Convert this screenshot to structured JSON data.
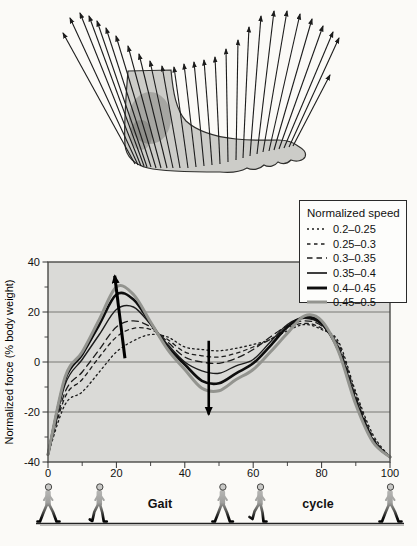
{
  "figure": {
    "background": "#fbfaf7"
  },
  "foot_diagram": {
    "description": "ground reaction force vectors over foot silhouette during stance",
    "foot_fill": "#ccccc8",
    "vector_color": "#1c1c1c",
    "vectors": [
      [
        135,
        164,
        63,
        33
      ],
      [
        138,
        165,
        70,
        18
      ],
      [
        141,
        166,
        80,
        13
      ],
      [
        144,
        166,
        89,
        16
      ],
      [
        147,
        167,
        97,
        21
      ],
      [
        151,
        167,
        106,
        28
      ],
      [
        156,
        168,
        116,
        36
      ],
      [
        161,
        168,
        128,
        46
      ],
      [
        167,
        168,
        139,
        54
      ],
      [
        173,
        168,
        150,
        61
      ],
      [
        180,
        168,
        162,
        66
      ],
      [
        188,
        168,
        174,
        67
      ],
      [
        196,
        167,
        184,
        64
      ],
      [
        204,
        166,
        194,
        62
      ],
      [
        212,
        165,
        204,
        60
      ],
      [
        220,
        164,
        215,
        57
      ],
      [
        228,
        162,
        226,
        49
      ],
      [
        236,
        160,
        238,
        40
      ],
      [
        243,
        158,
        249,
        27
      ],
      [
        250,
        156,
        261,
        16
      ],
      [
        257,
        154,
        274,
        11
      ],
      [
        263,
        152,
        287,
        11
      ],
      [
        269,
        151,
        300,
        14
      ],
      [
        274,
        150,
        312,
        19
      ],
      [
        279,
        149,
        323,
        26
      ],
      [
        284,
        148,
        333,
        32
      ],
      [
        289,
        147,
        339,
        38
      ],
      [
        293,
        146,
        330,
        75
      ]
    ]
  },
  "chart_data": {
    "type": "line",
    "title": "",
    "ylabel": "Normalized force (% body weight)",
    "xlabel": "Gait cycle",
    "xlim": [
      0,
      100
    ],
    "ylim": [
      -40,
      40
    ],
    "plot_bg": "#dadad7",
    "grid_y": [
      20,
      0,
      -20
    ],
    "xticks": [
      0,
      20,
      40,
      60,
      80,
      100
    ],
    "xticks_minor": [
      10,
      30,
      50,
      70,
      90
    ],
    "yticks": [
      40,
      20,
      0,
      -20,
      -40
    ],
    "yticks_minor": [
      30,
      10,
      -10,
      -30
    ],
    "legend": {
      "title": "Normalized speed",
      "position": "top-right"
    },
    "x": [
      0,
      5,
      10,
      15,
      20,
      25,
      30,
      35,
      40,
      45,
      50,
      55,
      60,
      65,
      70,
      75,
      80,
      85,
      90,
      95,
      100
    ],
    "series": [
      {
        "name": "0.2–0.25",
        "style": "dotted",
        "color": "#1c1c1c",
        "width": 1.3,
        "values": [
          -37,
          -17,
          -12,
          -4,
          4,
          8.5,
          11,
          10,
          6,
          5,
          4.5,
          5.5,
          7,
          9,
          12.5,
          15,
          13,
          8,
          -12,
          -29,
          -38
        ]
      },
      {
        "name": "0.25–0.3",
        "style": "dashed-short",
        "color": "#1c1c1c",
        "width": 1.3,
        "values": [
          -37,
          -14,
          -7,
          2,
          10,
          13.5,
          13,
          9,
          4,
          2.5,
          2,
          3.5,
          6,
          9,
          13.5,
          15.5,
          13.5,
          7,
          -13,
          -30,
          -38
        ]
      },
      {
        "name": "0.3–0.35",
        "style": "dashed",
        "color": "#1c1c1c",
        "width": 1.3,
        "values": [
          -37,
          -12,
          -4,
          5,
          14,
          16.5,
          14,
          8,
          2,
          0,
          -0.5,
          1.5,
          5,
          10,
          14.5,
          16.5,
          14.5,
          6,
          -14,
          -30.5,
          -38
        ]
      },
      {
        "name": "0.35–0.4",
        "style": "solid",
        "color": "#1c1c1c",
        "width": 1.4,
        "values": [
          -37,
          -9,
          1,
          11,
          21,
          22,
          15,
          7,
          0,
          -3.5,
          -4.5,
          -1.5,
          1,
          8,
          15,
          17.5,
          15,
          5.5,
          -15,
          -31,
          -38
        ]
      },
      {
        "name": "0.4–0.45",
        "style": "solid",
        "color": "#0e0e0e",
        "width": 2.6,
        "values": [
          -37,
          -7,
          3,
          15,
          27,
          25,
          15.5,
          6,
          -1,
          -7.5,
          -8.5,
          -4.5,
          -0.5,
          6.5,
          14,
          18,
          15.5,
          4.5,
          -16,
          -31.5,
          -38
        ]
      },
      {
        "name": "0.45–0.5",
        "style": "solid",
        "color": "#93948f",
        "width": 3,
        "values": [
          -37,
          -6,
          4,
          17,
          30,
          27,
          16,
          5,
          -3,
          -10.5,
          -11.5,
          -7,
          -3,
          4,
          11.5,
          18.5,
          16.5,
          4,
          -17,
          -32,
          -38
        ]
      }
    ],
    "annotations": [
      {
        "type": "arrow",
        "direction": "up",
        "from": [
          22.5,
          1.5
        ],
        "to": [
          19.5,
          34.5
        ]
      },
      {
        "type": "arrow",
        "direction": "down",
        "from": [
          47,
          8.5
        ],
        "to": [
          47,
          -21
        ]
      }
    ]
  },
  "footer": {
    "gait_label": "Gait",
    "cycle_label": "cycle",
    "walker_positions_pct": [
      0,
      15,
      51,
      62,
      100
    ]
  }
}
